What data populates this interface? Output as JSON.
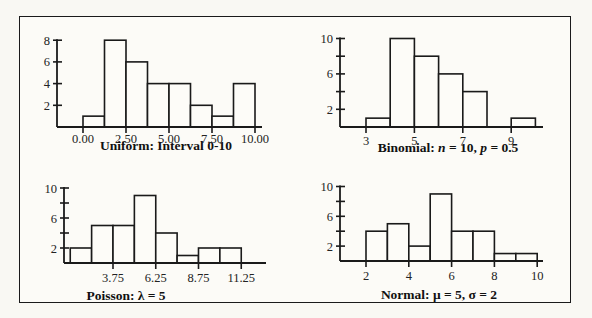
{
  "chart_data": [
    {
      "type": "bar",
      "title": "Uniform: Interval 0-10",
      "xlabel": "",
      "ylabel": "",
      "bin_edges": [
        0,
        1.25,
        2.5,
        3.75,
        5,
        6.25,
        7.5,
        8.75,
        10
      ],
      "values": [
        1,
        8,
        6,
        4,
        4,
        2,
        1,
        4
      ],
      "x_ticks": [
        "0.00",
        "2.50",
        "5.00",
        "7.50",
        "10.00"
      ],
      "x_tick_values": [
        0,
        2.5,
        5,
        7.5,
        10
      ],
      "y_ticks": [
        "2",
        "4",
        "6",
        "8"
      ],
      "y_tick_values": [
        2,
        4,
        6,
        8
      ],
      "xlim": [
        -1.6,
        10.5
      ],
      "ylim": [
        0,
        8
      ],
      "grid": false
    },
    {
      "type": "bar",
      "title": "Binomial: n = 10, p = 0.5",
      "title_parts": [
        "Binomial: ",
        "n",
        " = 10, ",
        "p",
        " = 0.5"
      ],
      "xlabel": "",
      "ylabel": "",
      "bin_edges": [
        3,
        4,
        5,
        6,
        7,
        8,
        9,
        10
      ],
      "values": [
        1,
        10,
        8,
        6,
        4,
        0,
        1
      ],
      "x_ticks": [
        "3",
        "5",
        "7",
        "9"
      ],
      "x_tick_values": [
        3,
        5,
        7,
        9
      ],
      "y_ticks": [
        "2",
        "",
        "6",
        "",
        "10"
      ],
      "y_tick_values": [
        2,
        4,
        6,
        8,
        10
      ],
      "xlim": [
        1.9,
        10.3
      ],
      "ylim": [
        0,
        10
      ],
      "grid": false
    },
    {
      "type": "bar",
      "title": "Poisson: λ = 5",
      "xlabel": "",
      "ylabel": "",
      "bin_edges": [
        1.25,
        2.5,
        3.75,
        5,
        6.25,
        7.5,
        8.75,
        10,
        11.25
      ],
      "values": [
        2,
        5,
        5,
        9,
        4,
        1,
        2,
        2
      ],
      "x_ticks": [
        "3.75",
        "6.25",
        "8.75",
        "11.25"
      ],
      "x_tick_values": [
        3.75,
        6.25,
        8.75,
        11.25
      ],
      "y_ticks": [
        "2",
        "",
        "6",
        "",
        "10"
      ],
      "y_tick_values": [
        2,
        4,
        6,
        8,
        10
      ],
      "xlim": [
        0.9,
        12.5
      ],
      "ylim": [
        0,
        10
      ],
      "grid": false
    },
    {
      "type": "bar",
      "title": "Normal: μ = 5, σ = 2",
      "xlabel": "",
      "ylabel": "",
      "bin_edges": [
        2,
        3,
        4,
        5,
        6,
        7,
        8,
        9,
        10
      ],
      "values": [
        4,
        5,
        2,
        9,
        4,
        4,
        1,
        1
      ],
      "x_ticks": [
        "2",
        "4",
        "6",
        "8",
        "10"
      ],
      "x_tick_values": [
        2,
        4,
        6,
        8,
        10
      ],
      "y_ticks": [
        "2",
        "",
        "6",
        "",
        "10"
      ],
      "y_tick_values": [
        2,
        4,
        6,
        8,
        10
      ],
      "xlim": [
        0.8,
        10.3
      ],
      "ylim": [
        0,
        10
      ],
      "grid": false
    }
  ]
}
